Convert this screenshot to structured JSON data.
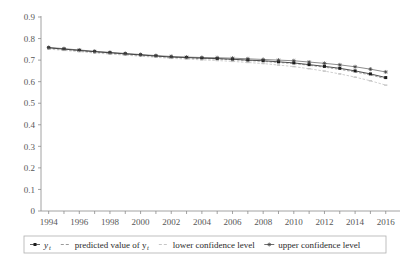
{
  "chart_data": {
    "type": "line",
    "title": "",
    "subtitle": "",
    "xlabel": "",
    "ylabel": "",
    "xlim": [
      1993.5,
      2016.8
    ],
    "ylim": [
      0,
      0.9
    ],
    "grid": false,
    "legend_position": "bottom",
    "x": [
      1994,
      1995,
      1996,
      1997,
      1998,
      1999,
      2000,
      2001,
      2002,
      2003,
      2004,
      2005,
      2006,
      2007,
      2008,
      2009,
      2010,
      2011,
      2012,
      2013,
      2014,
      2015,
      2016
    ],
    "y_tick_labels": [
      "0",
      "0.1",
      "0.2",
      "0.3",
      "0.4",
      "0.5",
      "0.6",
      "0.7",
      "0.8",
      "0.9"
    ],
    "y_tick_values": [
      0,
      0.1,
      0.2,
      0.3,
      0.4,
      0.5,
      0.6,
      0.7,
      0.8,
      0.9
    ],
    "x_tick_labels": [
      "1994",
      "1996",
      "1998",
      "2000",
      "2002",
      "2004",
      "2006",
      "2008",
      "2010",
      "2012",
      "2014",
      "2016"
    ],
    "x_tick_values": [
      1994,
      1996,
      1998,
      2000,
      2002,
      2004,
      2006,
      2008,
      2010,
      2012,
      2014,
      2016
    ],
    "x_minor_ticks": [
      1994,
      1995,
      1996,
      1997,
      1998,
      1999,
      2000,
      2001,
      2002,
      2003,
      2004,
      2005,
      2006,
      2007,
      2008,
      2009,
      2010,
      2011,
      2012,
      2013,
      2014,
      2015,
      2016
    ],
    "series": [
      {
        "name": "y_t",
        "label": "y",
        "sublabel": "t",
        "key": "actual",
        "color": "#1c1c1c",
        "marker": "square",
        "values": [
          0.757,
          0.751,
          0.745,
          0.739,
          0.734,
          0.729,
          0.724,
          0.719,
          0.714,
          0.712,
          0.709,
          0.707,
          0.704,
          0.7,
          0.697,
          0.692,
          0.687,
          0.679,
          0.671,
          0.662,
          0.65,
          0.636,
          0.619
        ]
      },
      {
        "name": "predicted value of y_t",
        "label": "predicted value of y",
        "sublabel": "t",
        "key": "predicted",
        "color": "#9a9a9a",
        "marker": "dash",
        "values": [
          0.755,
          0.749,
          0.743,
          0.737,
          0.732,
          0.727,
          0.722,
          0.717,
          0.713,
          0.71,
          0.707,
          0.705,
          0.702,
          0.698,
          0.694,
          0.689,
          0.684,
          0.676,
          0.667,
          0.657,
          0.645,
          0.631,
          0.614
        ]
      },
      {
        "name": "lower confidence level",
        "label": "lower confidence level",
        "sublabel": "",
        "key": "lower",
        "color": "#c2c2c2",
        "marker": "dash",
        "values": [
          0.751,
          0.745,
          0.739,
          0.733,
          0.728,
          0.723,
          0.718,
          0.713,
          0.708,
          0.705,
          0.701,
          0.698,
          0.694,
          0.689,
          0.684,
          0.677,
          0.67,
          0.66,
          0.649,
          0.636,
          0.621,
          0.604,
          0.584
        ]
      },
      {
        "name": "upper confidence level",
        "label": "upper confidence level",
        "sublabel": "",
        "key": "upper",
        "color": "#4a4a4a",
        "marker": "star",
        "values": [
          0.759,
          0.753,
          0.747,
          0.741,
          0.736,
          0.731,
          0.726,
          0.721,
          0.717,
          0.714,
          0.712,
          0.711,
          0.709,
          0.706,
          0.703,
          0.7,
          0.697,
          0.691,
          0.685,
          0.678,
          0.669,
          0.658,
          0.645
        ]
      }
    ]
  },
  "legend": {
    "items": [
      {
        "label": "y",
        "sublabel": "t",
        "marker": "line-dot",
        "italic": true
      },
      {
        "label": "predicted value of y",
        "sublabel": "t",
        "marker": "dash",
        "italic": false
      },
      {
        "label": "lower confidence level",
        "sublabel": "",
        "marker": "dash-light",
        "italic": false
      },
      {
        "label": "upper confidence level",
        "sublabel": "",
        "marker": "star",
        "italic": false
      }
    ]
  }
}
